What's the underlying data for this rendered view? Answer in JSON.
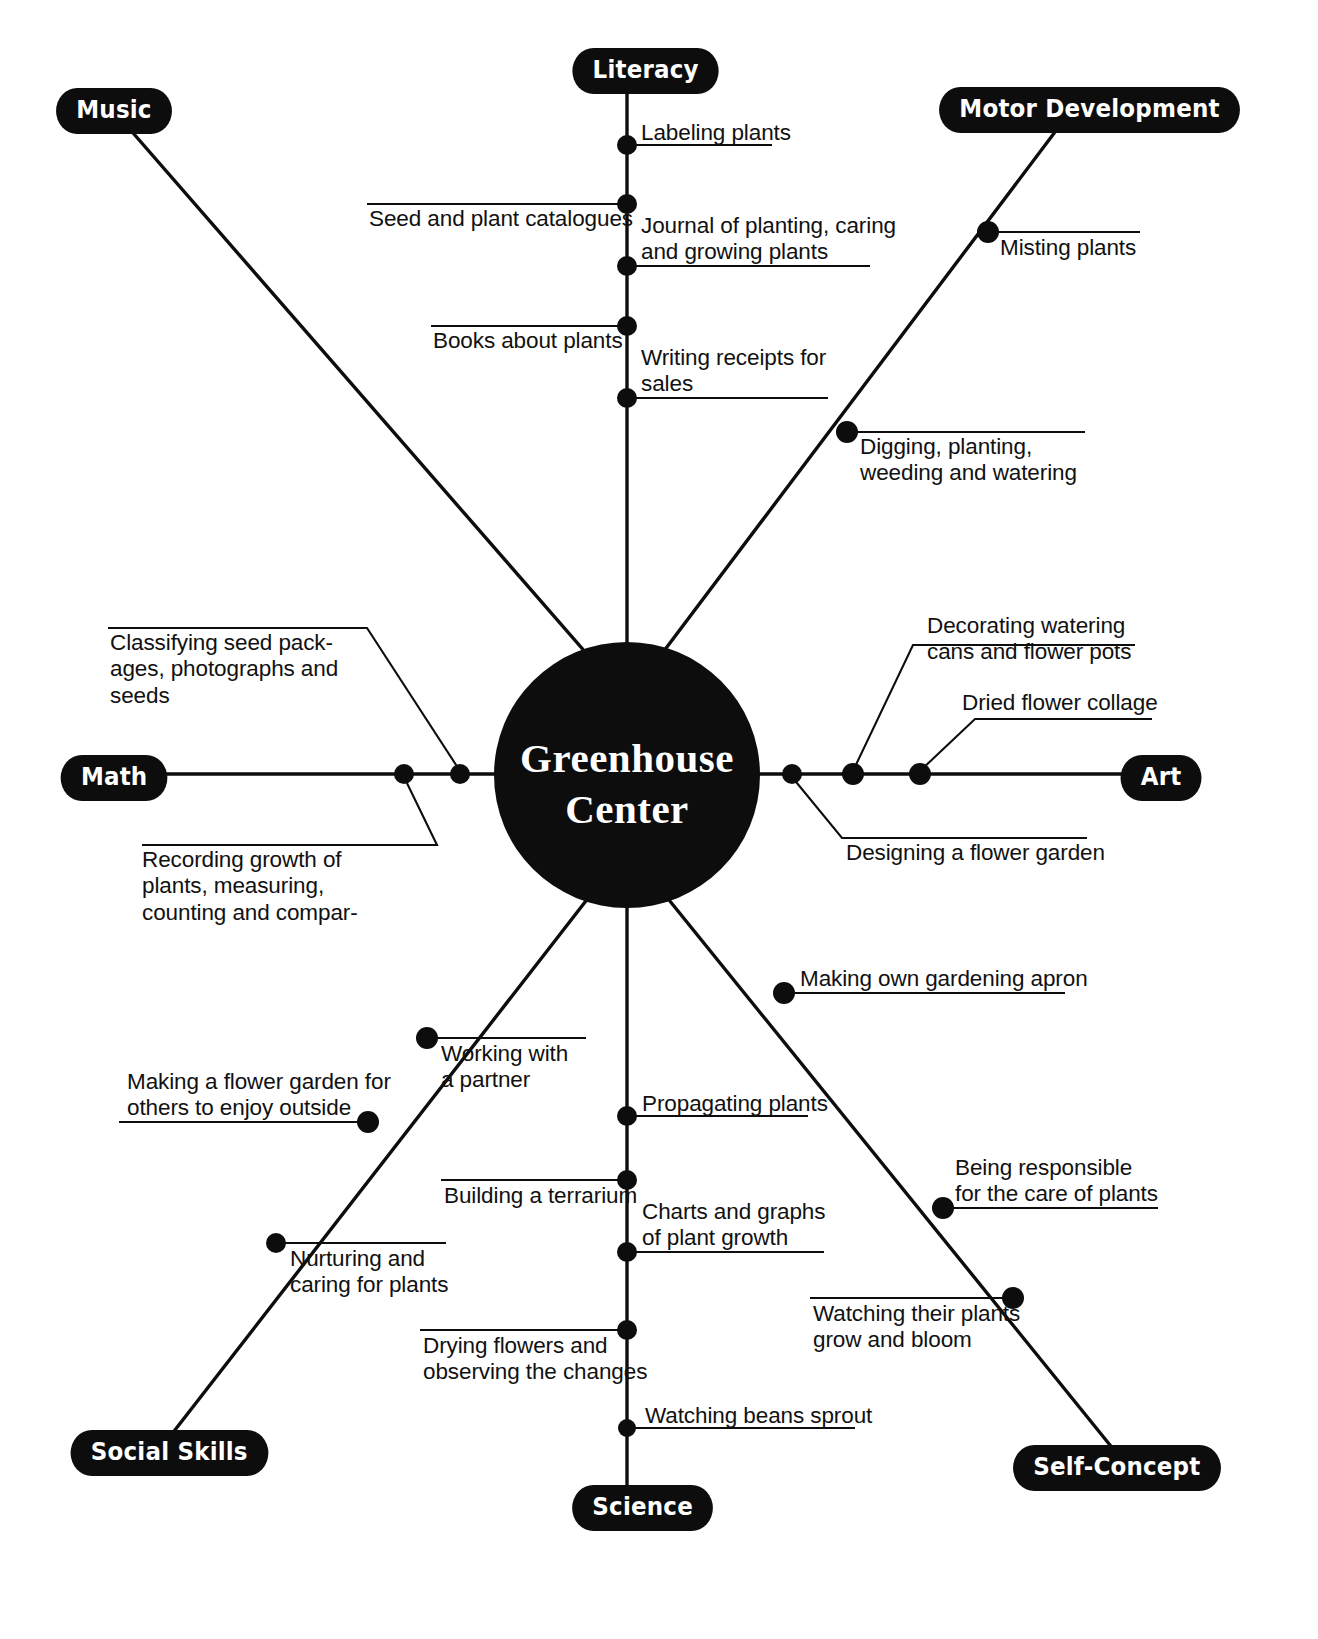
{
  "diagram": {
    "type": "mind-map",
    "center": {
      "line1": "Greenhouse",
      "line2": "Center"
    },
    "categories": [
      {
        "id": "literacy",
        "label": "Literacy"
      },
      {
        "id": "music",
        "label": "Music"
      },
      {
        "id": "motor",
        "label": "Motor Development"
      },
      {
        "id": "math",
        "label": "Math"
      },
      {
        "id": "art",
        "label": "Art"
      },
      {
        "id": "social",
        "label": "Social Skills"
      },
      {
        "id": "science",
        "label": "Science"
      },
      {
        "id": "self",
        "label": "Self-Concept"
      }
    ],
    "topics": {
      "literacy": [
        "Labeling plants",
        "Seed and plant catalogues",
        "Journal of planting, caring\nand growing plants",
        "Books about plants",
        "Writing receipts for\nsales"
      ],
      "motor": [
        "Misting plants",
        "Digging, planting,\nweeding and watering"
      ],
      "math": [
        "Classifying seed pack-\nages, photographs and\nseeds",
        "Recording growth of\nplants, measuring,\ncounting and compar-"
      ],
      "art": [
        "Decorating watering\ncans and flower pots",
        "Dried flower collage",
        "Designing a flower garden"
      ],
      "social": [
        "Working with\na partner",
        "Making a flower garden for\nothers to enjoy outside",
        "Nurturing and\ncaring for plants"
      ],
      "science": [
        "Propagating plants",
        "Building a terrarium",
        "Charts and graphs\nof plant growth",
        "Drying flowers and\nobserving the changes",
        "Watching beans sprout"
      ],
      "self": [
        "Making own gardening apron",
        "Being responsible\nfor the care of plants",
        "Watching their plants\ngrow and bloom"
      ]
    },
    "colors": {
      "ink": "#0d0d0d",
      "paper": "#ffffff",
      "pill_text": "#ffffff"
    }
  }
}
